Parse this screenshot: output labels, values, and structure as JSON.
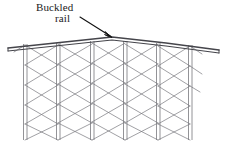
{
  "figure": {
    "type": "technical-line-drawing",
    "background_color": "#ffffff",
    "line_color": "#6e6e72",
    "rail_color": "#4a4a50",
    "leader_color": "#111111",
    "text_color": "#1a1a1a"
  },
  "annotation": {
    "label_line_1": "Buckled",
    "label_line_2": "rail",
    "leader": {
      "from_x": 80,
      "from_y": 17,
      "to_x": 112,
      "to_y": 37
    },
    "marker": {
      "x": 112,
      "y": 37,
      "label": "arrow-head"
    }
  },
  "rail": {
    "name": "buckled-rail",
    "description": "shallow peaked double-line rail, apex left of center",
    "left_x": 8,
    "left_y": 48,
    "apex_x": 112,
    "apex_y": 37,
    "right_x": 219,
    "right_y": 50,
    "thickness": 3
  },
  "structure": {
    "name": "lattice-trestle",
    "column_count": 6,
    "column_x": [
      25,
      58,
      92,
      125,
      158,
      190
    ],
    "column_top_y": 41,
    "column_bottom_y": 140,
    "column_width": 4,
    "bay_count": 5,
    "brace_levels": 5
  }
}
